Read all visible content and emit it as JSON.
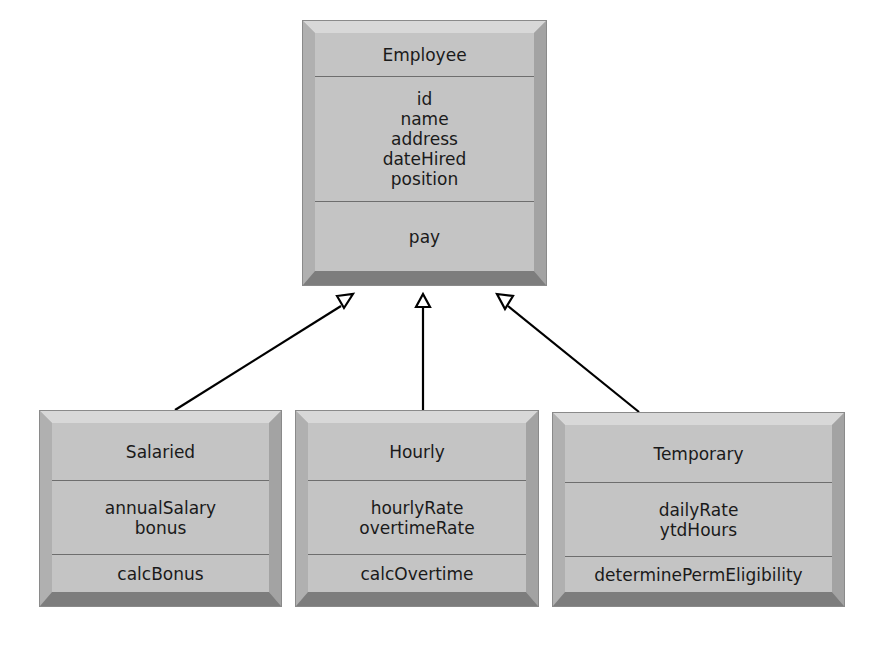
{
  "diagram": {
    "type": "uml-class-inheritance",
    "colors": {
      "box_face": "#c4c4c4",
      "bevel_light": "#d8d8d8",
      "bevel_dark": "#7d7d7d",
      "divider": "#6e6e6e",
      "text": "#1a1a1a",
      "connector": "#000000",
      "background": "#ffffff"
    },
    "superclass": {
      "name": "Employee",
      "attributes": [
        "id",
        "name",
        "address",
        "dateHired",
        "position"
      ],
      "operations": [
        "pay"
      ]
    },
    "subclasses": [
      {
        "name": "Salaried",
        "attributes": [
          "annualSalary",
          "bonus"
        ],
        "operations": [
          "calcBonus"
        ]
      },
      {
        "name": "Hourly",
        "attributes": [
          "hourlyRate",
          "overtimeRate"
        ],
        "operations": [
          "calcOvertime"
        ]
      },
      {
        "name": "Temporary",
        "attributes": [
          "dailyRate",
          "ytdHours"
        ],
        "operations": [
          "determinePermEligibility"
        ]
      }
    ],
    "relationships": [
      {
        "from": "Salaried",
        "to": "Employee",
        "kind": "generalization",
        "arrow": "hollow-triangle"
      },
      {
        "from": "Hourly",
        "to": "Employee",
        "kind": "generalization",
        "arrow": "hollow-triangle"
      },
      {
        "from": "Temporary",
        "to": "Employee",
        "kind": "generalization",
        "arrow": "hollow-triangle"
      }
    ]
  }
}
